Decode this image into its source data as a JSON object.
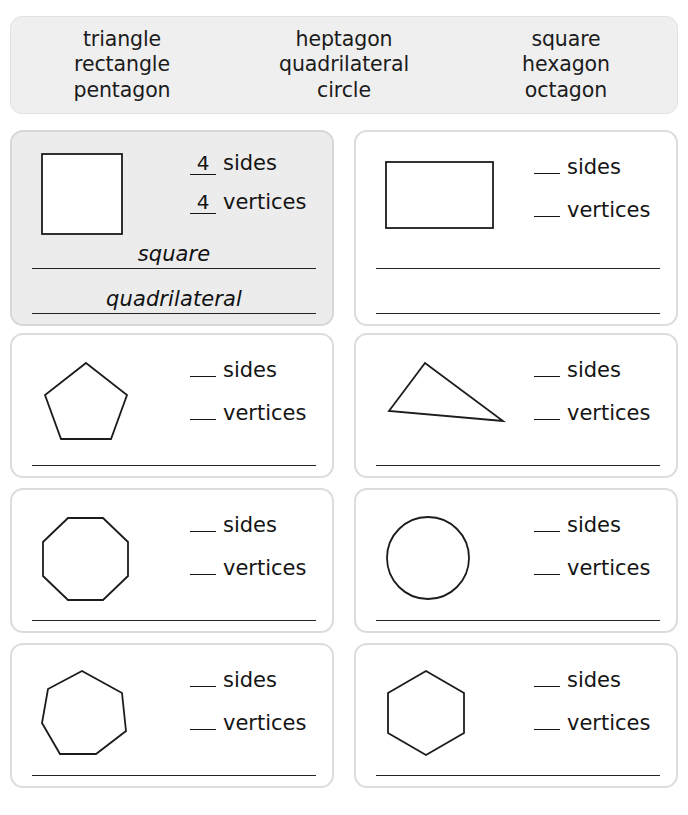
{
  "word_bank": {
    "columns": [
      {
        "words": [
          "triangle",
          "rectangle",
          "pentagon"
        ]
      },
      {
        "words": [
          "heptagon",
          "quadrilateral",
          "circle"
        ]
      },
      {
        "words": [
          "square",
          "hexagon",
          "octagon"
        ]
      }
    ]
  },
  "labels": {
    "sides": "sides",
    "vertices": "vertices",
    "blank": "__"
  },
  "cards": [
    {
      "shape": "square",
      "is_example": true,
      "sides_value": "4",
      "vertices_value": "4",
      "answers": [
        "square",
        "quadrilateral"
      ]
    },
    {
      "shape": "rectangle",
      "is_example": false,
      "sides_value": "__",
      "vertices_value": "__",
      "answers": [
        "",
        ""
      ]
    },
    {
      "shape": "pentagon",
      "is_example": false,
      "sides_value": "__",
      "vertices_value": "__",
      "answers": [
        ""
      ]
    },
    {
      "shape": "triangle",
      "is_example": false,
      "sides_value": "__",
      "vertices_value": "__",
      "answers": [
        ""
      ]
    },
    {
      "shape": "octagon",
      "is_example": false,
      "sides_value": "__",
      "vertices_value": "__",
      "answers": [
        ""
      ]
    },
    {
      "shape": "circle",
      "is_example": false,
      "sides_value": "__",
      "vertices_value": "__",
      "answers": [
        ""
      ]
    },
    {
      "shape": "heptagon",
      "is_example": false,
      "sides_value": "__",
      "vertices_value": "__",
      "answers": [
        ""
      ]
    },
    {
      "shape": "hexagon",
      "is_example": false,
      "sides_value": "__",
      "vertices_value": "__",
      "answers": [
        ""
      ]
    }
  ],
  "colors": {
    "card_border": "#dcdcdc",
    "example_fill": "#ececec",
    "bank_fill": "#efefef",
    "ink": "#1c1c1c"
  }
}
